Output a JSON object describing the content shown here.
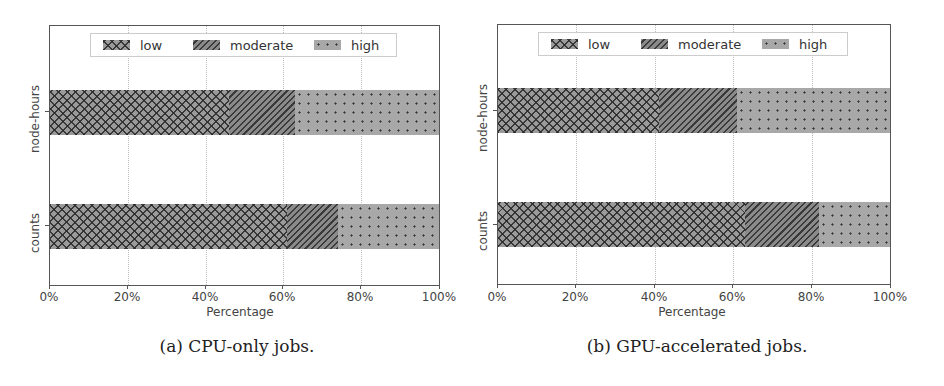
{
  "chart_data": [
    {
      "type": "bar",
      "orientation": "horizontal",
      "stacked": true,
      "caption": "(a) CPU-only jobs.",
      "categories": [
        "counts",
        "node-hours"
      ],
      "series": [
        {
          "name": "low",
          "values": [
            61,
            46
          ]
        },
        {
          "name": "moderate",
          "values": [
            13,
            17
          ]
        },
        {
          "name": "high",
          "values": [
            26,
            37
          ]
        }
      ],
      "xlabel": "Percentage",
      "ylabel": "",
      "xlim": [
        0,
        100
      ],
      "xticks": [
        "0%",
        "20%",
        "40%",
        "60%",
        "80%",
        "100%"
      ],
      "grid": true,
      "legend": {
        "position": "upper center",
        "entries": [
          "low",
          "moderate",
          "high"
        ]
      }
    },
    {
      "type": "bar",
      "orientation": "horizontal",
      "stacked": true,
      "caption": "(b) GPU-accelerated jobs.",
      "categories": [
        "counts",
        "node-hours"
      ],
      "series": [
        {
          "name": "low",
          "values": [
            63,
            41
          ]
        },
        {
          "name": "moderate",
          "values": [
            19,
            20
          ]
        },
        {
          "name": "high",
          "values": [
            18,
            39
          ]
        }
      ],
      "xlabel": "Percentage",
      "ylabel": "",
      "xlim": [
        0,
        100
      ],
      "xticks": [
        "0%",
        "20%",
        "40%",
        "60%",
        "80%",
        "100%"
      ],
      "grid": true,
      "legend": {
        "position": "upper center",
        "entries": [
          "low",
          "moderate",
          "high"
        ]
      }
    }
  ],
  "panels": [
    {
      "caption": "(a) CPU-only jobs.",
      "xlabel": "Percentage",
      "legend": [
        "low",
        "moderate",
        "high"
      ],
      "ycats": [
        "node-hours",
        "counts"
      ],
      "xticks": [
        "0%",
        "20%",
        "40%",
        "60%",
        "80%",
        "100%"
      ]
    },
    {
      "caption": "(b) GPU-accelerated jobs.",
      "xlabel": "Percentage",
      "legend": [
        "low",
        "moderate",
        "high"
      ],
      "ycats": [
        "node-hours",
        "counts"
      ],
      "xticks": [
        "0%",
        "20%",
        "40%",
        "60%",
        "80%",
        "100%"
      ]
    }
  ]
}
